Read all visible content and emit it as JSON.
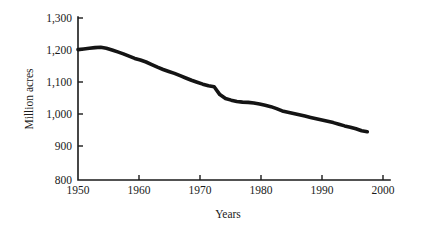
{
  "chart_data": {
    "type": "line",
    "title": "",
    "xlabel": "Years",
    "ylabel": "Million acres",
    "xlim": [
      1950,
      2005
    ],
    "ylim": [
      800,
      1300
    ],
    "grid": false,
    "legend": null,
    "x_ticks": [
      "1950",
      "1960",
      "1970",
      "1980",
      "1990",
      "2000"
    ],
    "x_tick_values": [
      1950,
      1960,
      1970,
      1980,
      1990,
      2000
    ],
    "y_ticks": [
      "800",
      "900",
      "1,000",
      "1,100",
      "1,200",
      "1,300"
    ],
    "y_tick_values": [
      800,
      900,
      1000,
      1100,
      1200,
      1300
    ],
    "line_color": "#141414",
    "series": [
      {
        "name": "Cropland",
        "x": [
          1950,
          1951,
          1952,
          1953,
          1954,
          1955,
          1956,
          1957,
          1958,
          1959,
          1960,
          1961,
          1962,
          1963,
          1964,
          1965,
          1966,
          1967,
          1968,
          1969,
          1970,
          1971,
          1972,
          1973,
          1974,
          1975,
          1976,
          1977,
          1978,
          1979,
          1980,
          1981,
          1982,
          1983,
          1984,
          1985,
          1986,
          1987,
          1988,
          1989,
          1990,
          1991,
          1992,
          1993,
          1994,
          1995,
          1996,
          1997,
          1998,
          1999,
          2000,
          2001
        ],
        "values": [
          1200,
          1202,
          1204,
          1206,
          1207,
          1204,
          1199,
          1193,
          1187,
          1180,
          1173,
          1168,
          1162,
          1154,
          1146,
          1139,
          1133,
          1127,
          1120,
          1113,
          1106,
          1100,
          1094,
          1089,
          1086,
          1062,
          1050,
          1045,
          1041,
          1039,
          1038,
          1036,
          1033,
          1029,
          1025,
          1019,
          1012,
          1008,
          1004,
          1000,
          996,
          992,
          988,
          984,
          980,
          976,
          971,
          966,
          962,
          957,
          951,
          948
        ]
      }
    ],
    "annotations": []
  }
}
